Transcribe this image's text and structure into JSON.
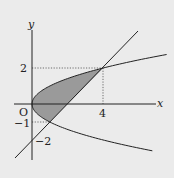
{
  "diagram": {
    "type": "area-between-curves",
    "curves": [
      {
        "name": "parabola",
        "equation": "y^2 = x"
      },
      {
        "name": "line",
        "equation": "y = x - 2"
      }
    ],
    "intersections": [
      [
        1,
        -1
      ],
      [
        4,
        2
      ]
    ],
    "shaded_region": "between y^2=x and y=x-2",
    "shade_color": "#9a9a9a",
    "background_color": "#ebebeb"
  },
  "labels": {
    "x_axis": "x",
    "y_axis": "y",
    "origin": "O",
    "x_tick_4": "4",
    "y_tick_2": "2",
    "y_tick_neg1": "−1",
    "y_tick_neg2": "−2"
  }
}
